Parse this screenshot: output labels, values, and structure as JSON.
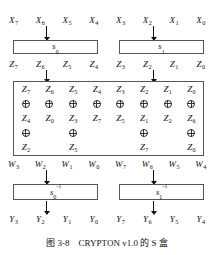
{
  "figure": {
    "caption": "图 3-8　CRYPTON v1.0 的 S 盒",
    "caption_number": "图 3-8",
    "caption_text": "CRYPTON v1.0 的 S 盒"
  },
  "rows": {
    "input_x": [
      {
        "base": "X",
        "sub": "7"
      },
      {
        "base": "X",
        "sub": "6"
      },
      {
        "base": "X",
        "sub": "5"
      },
      {
        "base": "X",
        "sub": "4"
      },
      {
        "base": "X",
        "sub": "3"
      },
      {
        "base": "X",
        "sub": "2"
      },
      {
        "base": "X",
        "sub": "1"
      },
      {
        "base": "X",
        "sub": "0"
      }
    ],
    "z_after_sbox": [
      {
        "base": "Z",
        "sub": "7"
      },
      {
        "base": "Z",
        "sub": "6"
      },
      {
        "base": "Z",
        "sub": "5"
      },
      {
        "base": "Z",
        "sub": "4"
      },
      {
        "base": "Z",
        "sub": "3"
      },
      {
        "base": "Z",
        "sub": "2"
      },
      {
        "base": "Z",
        "sub": "1"
      },
      {
        "base": "Z",
        "sub": "0"
      }
    ],
    "w_after_xor": [
      {
        "base": "W",
        "sub": "3"
      },
      {
        "base": "W",
        "sub": "2"
      },
      {
        "base": "W",
        "sub": "1"
      },
      {
        "base": "W",
        "sub": "0"
      },
      {
        "base": "W",
        "sub": "7"
      },
      {
        "base": "W",
        "sub": "6"
      },
      {
        "base": "W",
        "sub": "5"
      },
      {
        "base": "W",
        "sub": "4"
      }
    ],
    "output_y": [
      {
        "base": "Y",
        "sub": "3"
      },
      {
        "base": "Y",
        "sub": "2"
      },
      {
        "base": "Y",
        "sub": "1"
      },
      {
        "base": "Y",
        "sub": "0"
      },
      {
        "base": "Y",
        "sub": "7"
      },
      {
        "base": "Y",
        "sub": "6"
      },
      {
        "base": "Y",
        "sub": "5"
      },
      {
        "base": "Y",
        "sub": "4"
      }
    ]
  },
  "sboxes": {
    "forward": [
      {
        "base": "s",
        "sub": "0",
        "sup": ""
      },
      {
        "base": "s",
        "sub": "1",
        "sup": ""
      }
    ],
    "inverse": [
      {
        "base": "s",
        "sub": "0",
        "sup": "-1"
      },
      {
        "base": "s",
        "sub": "1",
        "sup": "-1"
      }
    ]
  },
  "xor_block": {
    "columns": [
      {
        "terms": [
          {
            "base": "Z",
            "sub": "7"
          },
          {
            "base": "Z",
            "sub": "4"
          },
          {
            "base": "Z",
            "sub": "2"
          }
        ],
        "ops": [
          "xor",
          "xor"
        ],
        "output": {
          "base": "W",
          "sub": "3"
        }
      },
      {
        "terms": [
          {
            "base": "Z",
            "sub": "6"
          },
          {
            "base": "Z",
            "sub": "0"
          }
        ],
        "ops": [
          "xor"
        ],
        "output": {
          "base": "W",
          "sub": "2"
        }
      },
      {
        "terms": [
          {
            "base": "Z",
            "sub": "5"
          },
          {
            "base": "Z",
            "sub": "3"
          },
          {
            "base": "Z",
            "sub": "5"
          }
        ],
        "ops": [
          "xor",
          "xor"
        ],
        "output": {
          "base": "W",
          "sub": "1"
        }
      },
      {
        "terms": [
          {
            "base": "Z",
            "sub": "4"
          },
          {
            "base": "Z",
            "sub": "7"
          }
        ],
        "ops": [
          "xor"
        ],
        "output": {
          "base": "W",
          "sub": "0"
        }
      },
      {
        "terms": [
          {
            "base": "Z",
            "sub": "3"
          },
          {
            "base": "Z",
            "sub": "5"
          }
        ],
        "ops": [
          "xor"
        ],
        "output": {
          "base": "W",
          "sub": "7"
        }
      },
      {
        "terms": [
          {
            "base": "Z",
            "sub": "2"
          },
          {
            "base": "Z",
            "sub": "1"
          },
          {
            "base": "Z",
            "sub": "7"
          }
        ],
        "ops": [
          "xor",
          "xor"
        ],
        "output": {
          "base": "W",
          "sub": "6"
        }
      },
      {
        "terms": [
          {
            "base": "Z",
            "sub": "1"
          },
          {
            "base": "Z",
            "sub": "2"
          }
        ],
        "ops": [
          "xor"
        ],
        "output": {
          "base": "W",
          "sub": "5"
        }
      },
      {
        "terms": [
          {
            "base": "Z",
            "sub": "0"
          },
          {
            "base": "Z",
            "sub": "6"
          },
          {
            "base": "Z",
            "sub": "0"
          }
        ],
        "ops": [
          "xor",
          "xor"
        ],
        "output": {
          "base": "W",
          "sub": "4"
        }
      }
    ],
    "cells": [
      [
        {
          "t": "var",
          "base": "Z",
          "sub": "7"
        },
        {
          "t": "var",
          "base": "Z",
          "sub": "6"
        },
        {
          "t": "var",
          "base": "Z",
          "sub": "5"
        },
        {
          "t": "var",
          "base": "Z",
          "sub": "4"
        },
        {
          "t": "var",
          "base": "Z",
          "sub": "3"
        },
        {
          "t": "var",
          "base": "Z",
          "sub": "2"
        },
        {
          "t": "var",
          "base": "Z",
          "sub": "1"
        },
        {
          "t": "var",
          "base": "Z",
          "sub": "0"
        }
      ],
      [
        {
          "t": "xor"
        },
        {
          "t": "xor"
        },
        {
          "t": "xor"
        },
        {
          "t": "xor"
        },
        {
          "t": "xor"
        },
        {
          "t": "xor"
        },
        {
          "t": "xor"
        },
        {
          "t": "xor"
        }
      ],
      [
        {
          "t": "var",
          "base": "Z",
          "sub": "4"
        },
        {
          "t": "var",
          "base": "Z",
          "sub": "0"
        },
        {
          "t": "var",
          "base": "Z",
          "sub": "3"
        },
        {
          "t": "var",
          "base": "Z",
          "sub": "7"
        },
        {
          "t": "var",
          "base": "Z",
          "sub": "5"
        },
        {
          "t": "var",
          "base": "Z",
          "sub": "1"
        },
        {
          "t": "var",
          "base": "Z",
          "sub": "2"
        },
        {
          "t": "var",
          "base": "Z",
          "sub": "6"
        }
      ],
      [
        {
          "t": "xor"
        },
        {
          "t": "empty"
        },
        {
          "t": "xor"
        },
        {
          "t": "empty"
        },
        {
          "t": "empty"
        },
        {
          "t": "xor"
        },
        {
          "t": "empty"
        },
        {
          "t": "xor"
        }
      ],
      [
        {
          "t": "var",
          "base": "Z",
          "sub": "2"
        },
        {
          "t": "empty"
        },
        {
          "t": "var",
          "base": "Z",
          "sub": "5"
        },
        {
          "t": "empty"
        },
        {
          "t": "empty"
        },
        {
          "t": "var",
          "base": "Z",
          "sub": "7"
        },
        {
          "t": "empty"
        },
        {
          "t": "var",
          "base": "Z",
          "sub": "0"
        }
      ]
    ]
  },
  "colors": {
    "line": "#555555",
    "text": "#111111",
    "background": "#ffffff"
  }
}
